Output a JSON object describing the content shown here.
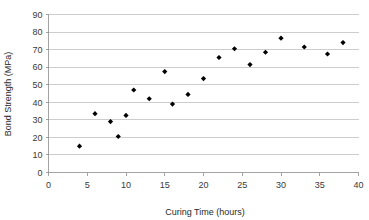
{
  "chart_data": {
    "type": "scatter",
    "title": "",
    "xlabel": "Curing Time (hours)",
    "ylabel": "Bond Strength (MPa)",
    "xlim": [
      0,
      40
    ],
    "ylim": [
      0,
      90
    ],
    "xticks": [
      0,
      5,
      10,
      15,
      20,
      25,
      30,
      35,
      40
    ],
    "yticks": [
      0,
      10,
      20,
      30,
      40,
      50,
      60,
      70,
      80,
      90
    ],
    "xtick_labels": [
      "0",
      "5",
      "10",
      "15",
      "20",
      "25",
      "30",
      "35",
      "40"
    ],
    "ytick_labels": [
      "0",
      "10",
      "20",
      "30",
      "40",
      "50",
      "60",
      "70",
      "80",
      "90"
    ],
    "grid": "horizontal",
    "legend": "none",
    "marker": "filled-diamond",
    "marker_color": "#000000",
    "series": [
      {
        "name": "Bond Strength",
        "points": [
          {
            "x": 4,
            "y": 15.0
          },
          {
            "x": 6,
            "y": 33.5
          },
          {
            "x": 8,
            "y": 29.0
          },
          {
            "x": 9,
            "y": 20.5
          },
          {
            "x": 10,
            "y": 32.5
          },
          {
            "x": 11,
            "y": 47.0
          },
          {
            "x": 13,
            "y": 42.0
          },
          {
            "x": 15,
            "y": 57.5
          },
          {
            "x": 16,
            "y": 39.0
          },
          {
            "x": 18,
            "y": 44.5
          },
          {
            "x": 20,
            "y": 53.5
          },
          {
            "x": 22,
            "y": 65.5
          },
          {
            "x": 24,
            "y": 70.5
          },
          {
            "x": 26,
            "y": 61.5
          },
          {
            "x": 28,
            "y": 68.5
          },
          {
            "x": 30,
            "y": 76.5
          },
          {
            "x": 33,
            "y": 71.5
          },
          {
            "x": 36,
            "y": 67.5
          },
          {
            "x": 38,
            "y": 74.0
          }
        ]
      }
    ]
  }
}
